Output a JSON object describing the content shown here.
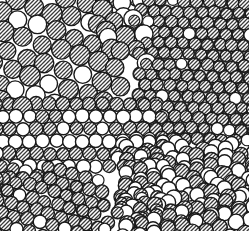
{
  "figure": {
    "title": "Bubble raft model of a polycrystalline packing",
    "width": 249,
    "height": 237,
    "background_color": "#ffffff",
    "ink_color": "#1a1a1a",
    "hatch_color": "#3a3a3a",
    "open_fill_color": "#ffffff",
    "border": "none",
    "edge_clipping": "circles clipped at top, left, right and bottom edges"
  },
  "chart_data": {
    "type": "scatter",
    "title": "Bubble raft model of a polycrystalline packing",
    "xlabel": "",
    "ylabel": "",
    "xlim": [
      0,
      249
    ],
    "ylim": [
      0,
      237
    ],
    "grid": false,
    "legend_position": "none",
    "marker_shape": "circle",
    "series": [
      {
        "name": "hatched-circles",
        "fill": "diagonal-hatch",
        "count": 470,
        "radius_range": [
          4.2,
          7.6
        ]
      },
      {
        "name": "open-circles",
        "fill": "white",
        "count": 300,
        "radius_range": [
          4.2,
          7.6
        ]
      }
    ],
    "regions": [
      {
        "name": "upper-left-grain",
        "packing": "loose hexagonal",
        "fill_mix": "mostly hatched",
        "orientation_deg": 18,
        "spacing": 19.5,
        "bounds": [
          0,
          0,
          120,
          100
        ]
      },
      {
        "name": "upper-centre-grain",
        "packing": "loose hexagonal",
        "fill_mix": "mostly open",
        "orientation_deg": -8,
        "spacing": 18.0,
        "bounds": [
          96,
          0,
          60,
          70
        ]
      },
      {
        "name": "upper-right-dense-grain",
        "packing": "dense hexagonal",
        "fill_mix": "almost all hatched",
        "orientation_deg": 62,
        "spacing": 12.2,
        "bounds": [
          140,
          0,
          109,
          130
        ]
      },
      {
        "name": "centre-row-grain",
        "packing": "close-packed horizontal rows",
        "fill_mix": "hatched rows alternating with open rows",
        "orientation_deg": 0,
        "spacing": 13.5,
        "bounds": [
          0,
          100,
          150,
          80
        ]
      },
      {
        "name": "lower-left-dense-grain",
        "packing": "dense hexagonal",
        "fill_mix": "mostly hatched",
        "orientation_deg": 75,
        "spacing": 13.0,
        "bounds": [
          0,
          165,
          90,
          72
        ]
      },
      {
        "name": "lower-right-grain",
        "packing": "close-packed inclined rows",
        "fill_mix": "alternating hatched and open",
        "orientation_deg": -14,
        "spacing": 15.0,
        "bounds": [
          130,
          150,
          119,
          87
        ]
      }
    ],
    "features": [
      {
        "name": "grain-boundary",
        "label": "",
        "path": "vertical boundary near x=140 separating loose left grain from dense right grain"
      },
      {
        "name": "grain-boundary",
        "label": "",
        "path": "diagonal boundary from (150,130) to (95,215)"
      },
      {
        "name": "vacancy",
        "label": "",
        "x": 165,
        "y": 95
      },
      {
        "name": "vacancy",
        "label": "",
        "x": 152,
        "y": 118
      },
      {
        "name": "vacancy",
        "label": "",
        "x": 186,
        "y": 62
      },
      {
        "name": "dislocation",
        "label": "",
        "x": 120,
        "y": 150
      },
      {
        "name": "open-region",
        "label": "",
        "x": 205,
        "y": 120
      }
    ]
  },
  "annotations": {
    "caption": "",
    "figure_number": "",
    "axis_tick_labels": []
  }
}
